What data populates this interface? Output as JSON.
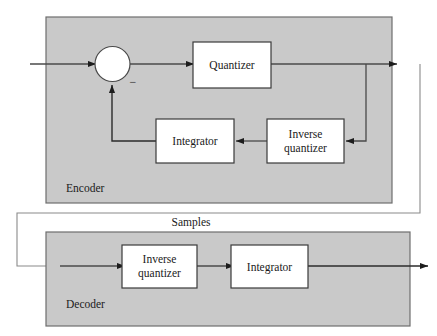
{
  "figure": {
    "kind": "block-diagram",
    "title_visible": false,
    "background_color": "#ffffff"
  },
  "colors": {
    "panel_fill": "#c9c9c9",
    "panel_stroke": "#6e6e6e",
    "box_fill": "#ffffff",
    "box_stroke": "#3a3a3a",
    "line": "#2b2b2b",
    "thin_line": "#8a8a8a",
    "text": "#1a1a1a"
  },
  "encoder": {
    "label": "Encoder",
    "blocks": [
      {
        "id": "enc-quantizer",
        "label": "Quantizer"
      },
      {
        "id": "enc-integrator",
        "label": "Integrator"
      },
      {
        "id": "enc-inverse-quantizer",
        "label_line1": "Inverse",
        "label_line2": "quantizer"
      }
    ],
    "summing_junction": {
      "id": "summing-junction",
      "shape": "circle",
      "sign": "−"
    }
  },
  "decoder": {
    "label": "Decoder",
    "blocks": [
      {
        "id": "dec-inverse-quantizer",
        "label_line1": "Inverse",
        "label_line2": "quantizer"
      },
      {
        "id": "dec-integrator",
        "label": "Integrator"
      }
    ]
  },
  "connections": {
    "samples_label": "Samples"
  }
}
